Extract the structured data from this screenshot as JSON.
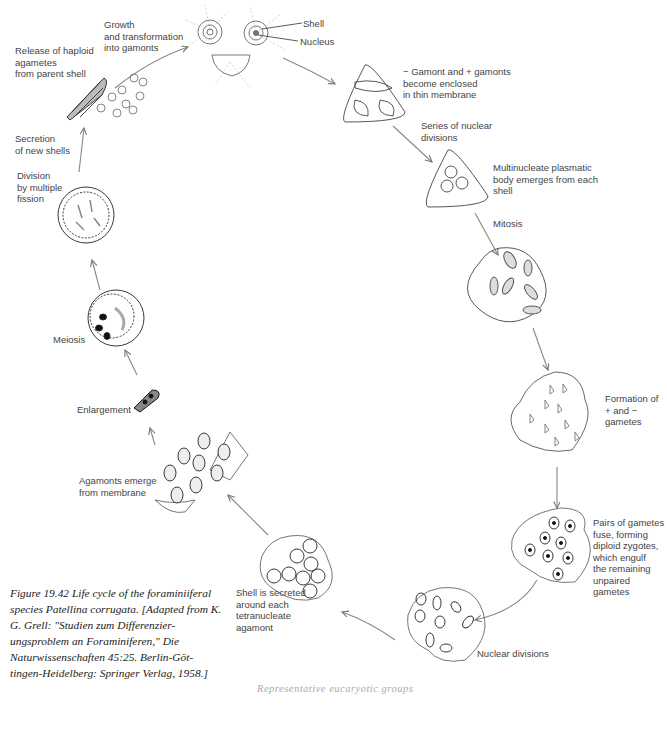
{
  "figure": {
    "caption": "Figure 19.42  Life cycle of the foraminiiferal species Patellina corrugata. [Adapted from K. G. Grell: \"Studien zum Differenzier-ungsproblem an Foraminiferen,\" Die Naturwissenschaften 45:25. Berlin-Göt-tingen-Heidelberg: Springer Verlag, 1958.]",
    "running_footer": "Representative eucaryotic groups"
  },
  "labels": {
    "growth": "Growth\nand transformation\ninto gamonts",
    "shell": "Shell",
    "nucleus": "Nucleus",
    "release": "Release of haploid\nagametes\nfrom parent shell",
    "secretion": "Secretion\nof new shells",
    "division": "Division\nby multiple\nfission",
    "gamont": "− Gamont and + gamonts\nbecome enclosed\nin thin membrane",
    "series": "Series of nuclear\ndivisions",
    "multinucleate": "Multinucleate plasmatic\nbody emerges from each\nshell",
    "mitosis": "Mitosis",
    "formation": "Formation of\n+ and −\ngametes",
    "pairs": "Pairs of gametes\nfuse, forming\ndiploid zygotes,\nwhich engulf\nthe remaining\nunpaired gametes",
    "nuclear_divisions": "Nuclear divisions",
    "shell_secreted": "Shell is secreted\naround each\ntetranucleate\nagamont",
    "agamonts": "Agamonts emerge\nfrom membrane",
    "enlargement": "Enlargement",
    "meiosis": "Meiosis"
  },
  "colors": {
    "line": "#777777",
    "ink": "#222222",
    "text": "#444444"
  }
}
